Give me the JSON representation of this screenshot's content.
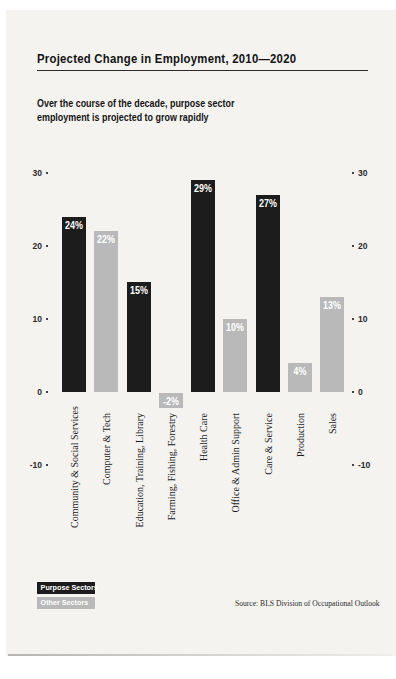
{
  "page": {
    "title": "Projected Change in Employment, 2010—2020",
    "subtitle_line1": "Over the course of the decade, purpose sector",
    "subtitle_line2": "employment is projected to grow rapidly",
    "source": "Source: BLS Division of Occupational Outlook"
  },
  "colors": {
    "purpose": "#1c1c1c",
    "other": "#b9b9b9",
    "page_bg": "#f4f3f0",
    "value_label_text": "#ffffff"
  },
  "legend": [
    {
      "label": "Purpose Sectors",
      "color": "#1c1c1c"
    },
    {
      "label": "Other Sectors",
      "color": "#b9b9b9"
    }
  ],
  "chart_data": {
    "type": "bar",
    "title": "Projected Change in Employment, 2010—2020",
    "subtitle": "Over the course of the decade, purpose sector employment is projected to grow rapidly",
    "categories": [
      "Community & Social Services",
      "Computer & Tech",
      "Education, Training, Library",
      "Farming, Fishing, Forestry",
      "Health Care",
      "Office & Admin Support",
      "Care & Service",
      "Production",
      "Sales"
    ],
    "values": [
      24,
      22,
      15,
      -2,
      29,
      10,
      27,
      4,
      13
    ],
    "bar_labels": [
      "24%",
      "22%",
      "15%",
      "-2%",
      "29%",
      "10%",
      "27%",
      "4%",
      "13%"
    ],
    "series_class": [
      "purpose",
      "other",
      "purpose",
      "other",
      "purpose",
      "other",
      "purpose",
      "other",
      "other"
    ],
    "yticks": [
      30,
      20,
      10,
      0,
      -10
    ],
    "ylim": [
      -10,
      32
    ],
    "xlabel": "",
    "ylabel": "",
    "grid": "off",
    "legend_position": "bottom-left",
    "legend": [
      "Purpose Sectors",
      "Other Sectors"
    ],
    "source": "Source: BLS Division of Occupational Outlook"
  }
}
